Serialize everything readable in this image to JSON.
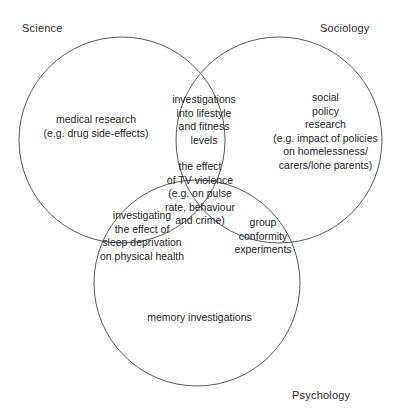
{
  "diagram": {
    "type": "venn",
    "sets": [
      {
        "key": "science",
        "label": "Science",
        "cx": 122,
        "cy": 140,
        "r": 103
      },
      {
        "key": "sociology",
        "label": "Sociology",
        "cx": 279,
        "cy": 140,
        "r": 103
      },
      {
        "key": "psychology",
        "label": "Psychology",
        "cx": 197,
        "cy": 283,
        "r": 103
      }
    ],
    "stroke_color": "#58595b",
    "text_color": "#262626",
    "background_color": "#ffffff",
    "regions": {
      "science_only": "medical research\n(e.g. drug side-effects)",
      "sociology_only": "social\npolicy\nresearch\n(e.g. impact of policies\non homelessness/\ncarers/lone parents)",
      "psychology_only": "memory investigations",
      "science_sociology": "investigations\ninto lifestyle\nand fitness\nlevels",
      "science_psychology": "investigating\nthe effect of\nsleep deprivation\non physical health",
      "sociology_psychology": "group\nconformity\nexperiments",
      "all_three": "the effect\nof TV violence\n(e.g. on pulse\nrate, behaviour\nand crime)"
    }
  }
}
